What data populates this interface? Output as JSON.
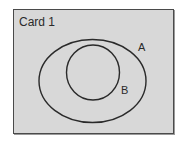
{
  "card": {
    "title": "Card 1",
    "background": "#d8d8d8",
    "border_color": "#4a4a4a"
  },
  "venn": {
    "sets": [
      {
        "id": "A",
        "label": "A",
        "shape": "ellipse",
        "contains": [
          "B"
        ]
      },
      {
        "id": "B",
        "label": "B",
        "shape": "circle",
        "subset_of": "A"
      }
    ],
    "relationship": "B is a subset of A",
    "stroke_color": "#2a2a2a"
  }
}
